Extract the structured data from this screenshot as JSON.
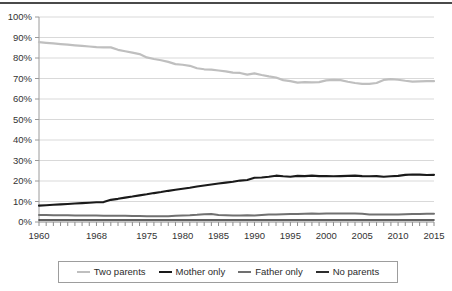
{
  "chart_data": {
    "type": "line",
    "title": "",
    "subtitle": "",
    "xlabel": "",
    "ylabel": "",
    "xlim": [
      1960,
      2015
    ],
    "ylim": [
      0,
      100
    ],
    "grid": true,
    "legend_position": "bottom",
    "y_ticks": [
      "0%",
      "10%",
      "20%",
      "30%",
      "40%",
      "50%",
      "60%",
      "70%",
      "80%",
      "90%",
      "100%"
    ],
    "y_tick_values": [
      0,
      10,
      20,
      30,
      40,
      50,
      60,
      70,
      80,
      90,
      100
    ],
    "x_tick_labels": [
      "1960",
      "1968",
      "1975",
      "1980",
      "1985",
      "1990",
      "1995",
      "2000",
      "2005",
      "2010",
      "2015"
    ],
    "x_tick_label_values": [
      1960,
      1968,
      1975,
      1980,
      1985,
      1990,
      1995,
      2000,
      2005,
      2010,
      2015
    ],
    "x": [
      1960,
      1961,
      1962,
      1963,
      1964,
      1965,
      1966,
      1967,
      1968,
      1969,
      1970,
      1971,
      1972,
      1973,
      1974,
      1975,
      1976,
      1977,
      1978,
      1979,
      1980,
      1981,
      1982,
      1983,
      1984,
      1985,
      1986,
      1987,
      1988,
      1989,
      1990,
      1991,
      1992,
      1993,
      1994,
      1995,
      1996,
      1997,
      1998,
      1999,
      2000,
      2001,
      2002,
      2003,
      2004,
      2005,
      2006,
      2007,
      2008,
      2009,
      2010,
      2011,
      2012,
      2013,
      2014,
      2015
    ],
    "series": [
      {
        "name": "Two parents",
        "color": "#bfbfbf",
        "width": 2.2,
        "values": [
          87.7,
          87.4,
          87.1,
          86.8,
          86.5,
          86.2,
          85.9,
          85.6,
          85.3,
          85.2,
          85.2,
          84.0,
          83.3,
          82.6,
          81.9,
          80.3,
          79.5,
          78.9,
          78.1,
          77.0,
          76.7,
          76.2,
          75.0,
          74.5,
          74.3,
          73.9,
          73.5,
          72.9,
          72.7,
          71.9,
          72.5,
          71.7,
          71.0,
          70.5,
          69.2,
          68.7,
          68.0,
          68.2,
          68.1,
          68.2,
          69.1,
          69.3,
          69.2,
          68.4,
          67.8,
          67.4,
          67.4,
          67.8,
          69.3,
          69.7,
          69.4,
          68.9,
          68.5,
          68.6,
          68.7,
          68.7
        ]
      },
      {
        "name": "Mother only",
        "color": "#1a1a1a",
        "width": 2.1,
        "values": [
          8.0,
          8.2,
          8.4,
          8.6,
          8.8,
          9.0,
          9.2,
          9.4,
          9.6,
          9.7,
          10.8,
          11.3,
          11.9,
          12.4,
          13.0,
          13.5,
          14.1,
          14.6,
          15.2,
          15.7,
          16.2,
          16.7,
          17.3,
          17.8,
          18.3,
          18.8,
          19.2,
          19.6,
          20.2,
          20.5,
          21.6,
          21.7,
          22.1,
          22.6,
          22.3,
          22.1,
          22.5,
          22.4,
          22.6,
          22.4,
          22.4,
          22.3,
          22.4,
          22.5,
          22.6,
          22.4,
          22.3,
          22.4,
          22.1,
          22.3,
          22.5,
          23.0,
          23.2,
          23.1,
          22.9,
          23.0
        ]
      },
      {
        "name": "Father only",
        "color": "#707070",
        "width": 2.0,
        "values": [
          3.4,
          3.4,
          3.3,
          3.3,
          3.3,
          3.2,
          3.2,
          3.2,
          3.2,
          3.1,
          3.1,
          3.1,
          3.0,
          2.9,
          2.9,
          2.8,
          2.8,
          2.8,
          2.8,
          3.1,
          3.2,
          3.3,
          3.5,
          3.8,
          3.9,
          3.4,
          3.3,
          3.2,
          3.2,
          3.3,
          3.2,
          3.4,
          3.6,
          3.7,
          3.8,
          3.9,
          3.9,
          4.0,
          4.1,
          4.0,
          4.1,
          4.1,
          4.1,
          4.1,
          4.1,
          4.0,
          3.7,
          3.7,
          3.7,
          3.6,
          3.7,
          3.8,
          3.9,
          3.9,
          4.0,
          4.0
        ]
      },
      {
        "name": "No parents",
        "color": "#2e2e2e",
        "width": 1.6,
        "values": [
          1.0,
          1.0,
          1.0,
          1.0,
          1.0,
          1.0,
          1.0,
          1.0,
          1.0,
          1.0,
          1.0,
          1.0,
          1.0,
          1.0,
          1.0,
          1.0,
          1.0,
          1.0,
          1.0,
          1.0,
          1.0,
          1.0,
          1.0,
          1.0,
          1.0,
          1.0,
          1.0,
          1.0,
          1.0,
          1.0,
          1.0,
          1.0,
          1.0,
          1.0,
          1.0,
          1.0,
          1.0,
          1.0,
          1.0,
          1.0,
          1.0,
          1.0,
          1.0,
          1.0,
          1.0,
          1.0,
          1.0,
          1.0,
          1.0,
          1.0,
          1.0,
          1.0,
          1.0,
          1.0,
          1.0,
          1.0
        ]
      }
    ]
  },
  "legend": {
    "items": [
      {
        "label": "Two parents",
        "color": "#bfbfbf",
        "width": 2.4
      },
      {
        "label": "Mother only",
        "color": "#1a1a1a",
        "width": 2.6
      },
      {
        "label": "Father only",
        "color": "#707070",
        "width": 2.2
      },
      {
        "label": "No parents",
        "color": "#2e2e2e",
        "width": 2.2
      }
    ]
  }
}
